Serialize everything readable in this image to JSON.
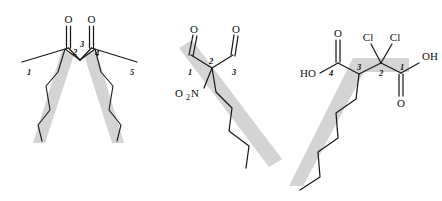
{
  "figure": {
    "type": "chemical-structure-diagram",
    "background_color": "#ffffff",
    "bond_color": "#1a1a1a",
    "highlight_color": "#d4d4d4",
    "highlight_meaning": "longest carbon chain highlighted in gray",
    "structure_count": 3
  },
  "structures": [
    {
      "id": "structure-1",
      "name": "diketone-crossed-chains",
      "locants": [
        "1",
        "2",
        "3",
        "4",
        "5"
      ],
      "atom_labels": [
        {
          "text": "O",
          "role": "ketone-oxygen-left"
        },
        {
          "text": "O",
          "role": "ketone-oxygen-right"
        }
      ],
      "functional_groups": [
        "ketone",
        "ketone"
      ],
      "highlight_bands": 2
    },
    {
      "id": "structure-2",
      "name": "nitro-dialdehyde",
      "locants": [
        "1",
        "2",
        "3"
      ],
      "atom_labels": [
        {
          "text": "O",
          "role": "aldehyde-oxygen-left"
        },
        {
          "text": "O",
          "role": "aldehyde-oxygen-right"
        },
        {
          "text": "O",
          "sub": "2",
          "tail": "N",
          "role": "nitro-group"
        }
      ],
      "nitro_main": "O",
      "nitro_sub": "2",
      "nitro_tail": "N",
      "functional_groups": [
        "aldehyde",
        "aldehyde",
        "nitro"
      ],
      "highlight_bands": 1
    },
    {
      "id": "structure-3",
      "name": "dichloro-dicarboxylic-acid",
      "locants": [
        "1",
        "2",
        "3",
        "4"
      ],
      "atom_labels": [
        {
          "text": "O",
          "role": "carboxyl-oxygen-top-left"
        },
        {
          "text": "HO",
          "role": "hydroxyl-left"
        },
        {
          "text": "Cl",
          "role": "chlorine-left"
        },
        {
          "text": "Cl",
          "role": "chlorine-right"
        },
        {
          "text": "OH",
          "role": "hydroxyl-right"
        },
        {
          "text": "O",
          "role": "carboxyl-oxygen-bottom-right"
        }
      ],
      "functional_groups": [
        "carboxylic-acid",
        "carboxylic-acid",
        "chloro",
        "chloro"
      ],
      "highlight_bands": 1
    }
  ],
  "labels": {
    "o": "O",
    "ho": "HO",
    "oh": "OH",
    "cl": "Cl",
    "n": "N",
    "two": "2",
    "n1": "1",
    "n2": "2",
    "n3": "3",
    "n4": "4",
    "n5": "5"
  }
}
